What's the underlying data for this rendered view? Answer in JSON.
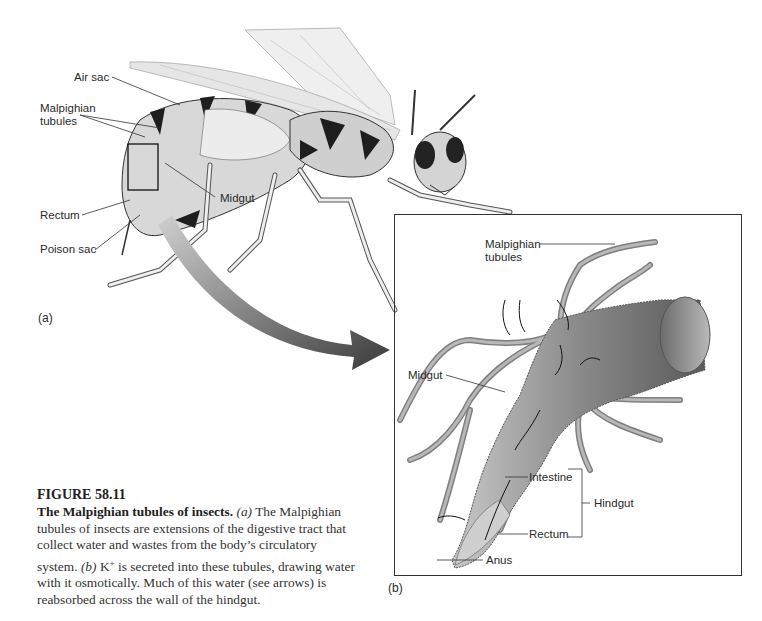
{
  "figure": {
    "number": "FIGURE 58.11",
    "title": "The Malpighian tubules of insects.",
    "caption_parts": [
      {
        "type": "italic",
        "text": "(a)"
      },
      {
        "type": "text",
        "text": " The Malpighian tubules of insects are extensions of the digestive tract that collect water and wastes from the body’s circulatory system. "
      },
      {
        "type": "italic",
        "text": "(b)"
      },
      {
        "type": "text",
        "text": " K"
      },
      {
        "type": "sup",
        "text": "+"
      },
      {
        "type": "text",
        "text": " is secreted into these tubules, drawing water with it osmotically. Much of this water (see arrows) is reabsorbed across the wall of the hindgut."
      }
    ]
  },
  "panel_a": {
    "letter": "(a)",
    "labels": {
      "air_sac": "Air sac",
      "malpighian_1": "Malpighian",
      "malpighian_2": "tubules",
      "midgut": "Midgut",
      "rectum": "Rectum",
      "poison_sac": "Poison sac"
    }
  },
  "panel_b": {
    "letter": "(b)",
    "labels": {
      "malpighian_1": "Malpighian",
      "malpighian_2": "tubules",
      "midgut": "Midgut",
      "intestine": "Intestine",
      "hindgut": "Hindgut",
      "rectum": "Rectum",
      "anus": "Anus"
    }
  },
  "colors": {
    "line": "#333333",
    "tissue_light": "#d9d9d9",
    "tissue_mid": "#9a9a9a",
    "tissue_dark": "#1e1e1e"
  }
}
